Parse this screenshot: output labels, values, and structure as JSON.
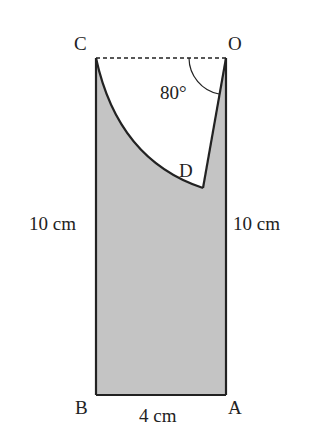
{
  "figure": {
    "points": {
      "C": "C",
      "O": "O",
      "D": "D",
      "B": "B",
      "A": "A"
    },
    "angle_label": "80°",
    "left_side": "10 cm",
    "right_side": "10 cm",
    "bottom_side": "4 cm",
    "colors": {
      "shade": "#c4c4c4",
      "stroke": "#222222"
    }
  }
}
